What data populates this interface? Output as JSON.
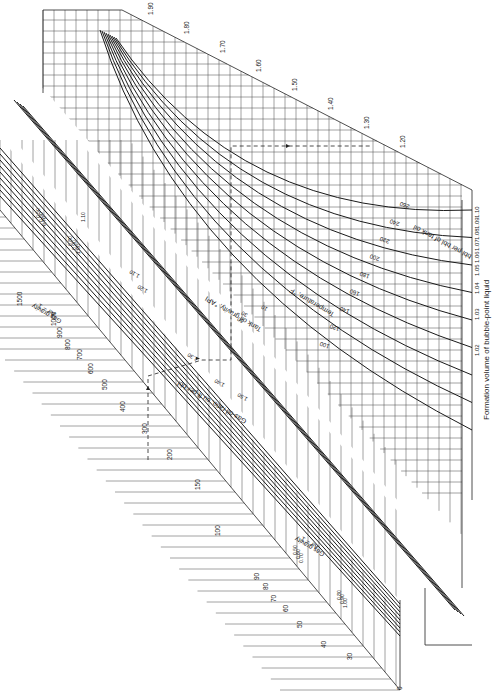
{
  "chart_data": {
    "type": "line",
    "subtype": "nomograph",
    "orientation": "rotated 90 degrees clockwise",
    "scales": {
      "formation_volume": {
        "label": "Formation volume of bubble-point liquid",
        "sublabel": "bbl per bbl of tank oil",
        "ticks": [
          "1.02",
          "1.03",
          "1.04",
          "1.05",
          "1.06",
          "1.07",
          "1.08",
          "1.09",
          "1.10",
          "1.20",
          "1.30",
          "1.40",
          "1.50",
          "1.60",
          "1.70",
          "1.80",
          "1.90"
        ]
      },
      "gas_oil_ratio": {
        "label": "Gas-oil ratio, cu ft per bbl",
        "ticks": [
          "0",
          "30",
          "40",
          "50",
          "60",
          "70",
          "80",
          "90",
          "100",
          "150",
          "200",
          "300",
          "400",
          "500",
          "600",
          "700",
          "800",
          "900",
          "1000",
          "1500"
        ]
      },
      "temperature": {
        "label": "Temperature, °F",
        "curves": [
          "100",
          "120",
          "140",
          "160",
          "180",
          "200",
          "220",
          "240",
          "260"
        ]
      },
      "tank_oil_gravity": {
        "label": "Tank oil gravity, °API",
        "values": [
          "10",
          "30",
          "50",
          "1.10",
          "1.20",
          "1.30",
          "1.40",
          "1.50"
        ]
      },
      "gas_gravity": {
        "label": "Gas gravity",
        "sublabel": "Air = 1",
        "values_low": [
          "0.50",
          "0.60",
          "0.70"
        ],
        "values_high": [
          "0.80",
          "0.90",
          "1.00"
        ],
        "upper_set": [
          "0.50",
          "0.60",
          "0.70",
          "0.80",
          "0.90",
          "1.00",
          "1.10"
        ],
        "lower_set": [
          "0.50",
          "0.60",
          "0.70",
          "0.80",
          "0.90",
          "1.00"
        ]
      }
    },
    "example_path": "dashed line with arrows showing solution: GOR ~350 → gas gravity → oil gravity → temperature → Bo ~1.22",
    "grid": true,
    "legend": null
  },
  "labels": {
    "bo_axis_title": "Formation volume of bubble-point liquid",
    "bo_axis_unit": "bbl per bbl of tank oil",
    "gor_axis_title": "Gas-oil ratio, cu ft per bbl",
    "temperature_title": "Temperature, °F",
    "oil_gravity_title": "Tank oil gravity, °API",
    "gas_gravity_title_upper": "Gas gravity",
    "gas_gravity_sub_upper": "Air = 1",
    "gas_gravity_title_lower": "Gas gravity",
    "gas_gravity_sub_lower": "Air = 1"
  }
}
